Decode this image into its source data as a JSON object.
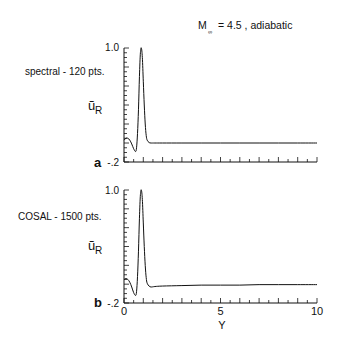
{
  "chart_data": [
    {
      "type": "line",
      "panel_label": "a",
      "method_label": "spectral - 120 pts.",
      "title": "M∞ = 4.5 , adiabatic",
      "title_main": "M",
      "title_sub": "∞",
      "title_rest": "= 4.5 , adiabatic",
      "ylabel_main": "ũ",
      "ylabel_sub": "R",
      "xlabel": "",
      "xlim": [
        0,
        10
      ],
      "ylim": [
        -0.2,
        1.0
      ],
      "y_tick_labels": [
        "1.0",
        "-.2"
      ],
      "x_tick_labels": [],
      "grid": false,
      "series": [
        {
          "name": "spectral",
          "x": [
            0,
            0.1,
            0.2,
            0.3,
            0.4,
            0.5,
            0.6,
            0.65,
            0.7,
            0.75,
            0.8,
            0.85,
            0.9,
            0.95,
            1.0,
            1.05,
            1.1,
            1.15,
            1.2,
            1.3,
            1.4,
            1.6,
            2.0,
            3,
            4,
            5,
            6,
            7,
            8,
            9,
            10
          ],
          "y": [
            0.03,
            0.05,
            0.05,
            0.03,
            -0.01,
            -0.06,
            -0.09,
            -0.05,
            0.1,
            0.35,
            0.7,
            0.95,
            1.0,
            0.9,
            0.65,
            0.4,
            0.2,
            0.08,
            0.03,
            0.005,
            0.0,
            0.0,
            0.0,
            0.0,
            0.0,
            0.0,
            0.0,
            0.0,
            0.0,
            0.0,
            0.0
          ]
        }
      ]
    },
    {
      "type": "line",
      "panel_label": "b",
      "method_label": "COSAL - 1500 pts.",
      "ylabel_main": "ũ",
      "ylabel_sub": "R",
      "xlabel": "Y",
      "xlim": [
        0,
        10
      ],
      "ylim": [
        -0.2,
        1.0
      ],
      "y_tick_labels": [
        "1.0",
        "-.2"
      ],
      "x_tick_labels": [
        "0",
        "5",
        "10"
      ],
      "x_tick_values": [
        0,
        5,
        10
      ],
      "grid": false,
      "series": [
        {
          "name": "COSAL",
          "x": [
            0,
            0.1,
            0.2,
            0.3,
            0.4,
            0.5,
            0.6,
            0.65,
            0.7,
            0.75,
            0.8,
            0.85,
            0.9,
            0.95,
            1.0,
            1.05,
            1.1,
            1.15,
            1.2,
            1.3,
            1.4,
            1.6,
            2.0,
            3,
            4,
            5,
            6,
            7,
            8,
            9,
            10
          ],
          "y": [
            0.05,
            0.06,
            0.05,
            0.02,
            -0.03,
            -0.09,
            -0.12,
            -0.08,
            0.08,
            0.35,
            0.7,
            0.95,
            1.0,
            0.9,
            0.65,
            0.4,
            0.2,
            0.07,
            0.01,
            -0.02,
            -0.03,
            -0.025,
            -0.02,
            -0.015,
            -0.01,
            -0.01,
            -0.01,
            -0.005,
            -0.005,
            -0.005,
            -0.005
          ]
        }
      ]
    }
  ]
}
